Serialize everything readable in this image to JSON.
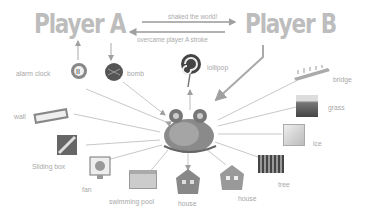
{
  "players": {
    "a": {
      "label": "Player A"
    },
    "b": {
      "label": "Player B"
    }
  },
  "edges_top": {
    "a_to_b": "shaked the world!",
    "b_to_a": "overcame player A stroke"
  },
  "center": {
    "name": "snail-monster"
  },
  "items": [
    {
      "key": "alarm_clock",
      "label": "alarm clock"
    },
    {
      "key": "bomb",
      "label": "bomb"
    },
    {
      "key": "lollipop",
      "label": "lollipop"
    },
    {
      "key": "bridge",
      "label": "bridge"
    },
    {
      "key": "grass",
      "label": "grass"
    },
    {
      "key": "ice",
      "label": "ice"
    },
    {
      "key": "tree",
      "label": "tree"
    },
    {
      "key": "house2",
      "label": "house"
    },
    {
      "key": "house1",
      "label": "house"
    },
    {
      "key": "swimming_pool",
      "label": "swimming pool"
    },
    {
      "key": "fan",
      "label": "fan"
    },
    {
      "key": "sliding_box",
      "label": "Sliding box"
    },
    {
      "key": "wall",
      "label": "wall"
    }
  ],
  "colors": {
    "text": "#a8a8a8",
    "line": "#c8c8c8",
    "arrow": "#9a9a9a",
    "player": "#bdbdbd"
  }
}
